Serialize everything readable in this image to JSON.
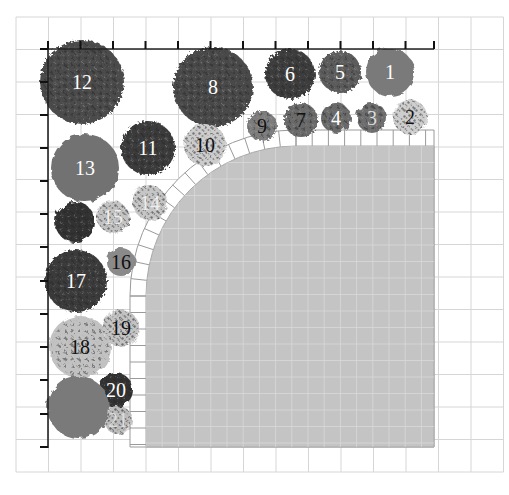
{
  "diagram": {
    "type": "garden-planting-plan",
    "grid": {
      "origin_x": 16,
      "origin_y": 17,
      "cell": 32.5,
      "cols": 15,
      "rows": 14,
      "line_color": "#d6d6d6"
    },
    "rulers": {
      "top": {
        "x1": 42,
        "x2": 434,
        "y": 49,
        "ticks_x": [
          48,
          80.5,
          113,
          145.5,
          178,
          210.5,
          243,
          275.5,
          308,
          340.5,
          373,
          405.5,
          434
        ]
      },
      "left": {
        "x": 48,
        "y1": 49,
        "y2": 448,
        "ticks_y": [
          49,
          82,
          115,
          148,
          181,
          214,
          247,
          281,
          314,
          347,
          380,
          414,
          447
        ]
      }
    },
    "patio": {
      "fill": "#c4c4c4",
      "x": 146,
      "y": 146,
      "width": 288,
      "height": 301,
      "corner_radius": 150,
      "border_band_width": 16
    },
    "plants": [
      {
        "id": "1",
        "label": "1",
        "cx": 390,
        "cy": 72,
        "r": 24,
        "fill": "#7a7a7a",
        "label_color": "#ffffff",
        "style": "solid"
      },
      {
        "id": "2",
        "label": "2",
        "cx": 410,
        "cy": 117,
        "r": 17,
        "fill": "#bdbdbd",
        "label_color": "#111111",
        "style": "speckle"
      },
      {
        "id": "3",
        "label": "3",
        "cx": 372,
        "cy": 118,
        "r": 15,
        "fill": "#6e6e6e",
        "label_color": "#dddddd",
        "style": "blob"
      },
      {
        "id": "4",
        "label": "4",
        "cx": 336,
        "cy": 118,
        "r": 15,
        "fill": "#6a6a6a",
        "label_color": "#ffffff",
        "style": "blob"
      },
      {
        "id": "5",
        "label": "5",
        "cx": 340,
        "cy": 72,
        "r": 21,
        "fill": "#5c5c5c",
        "label_color": "#ffffff",
        "style": "leafy"
      },
      {
        "id": "6",
        "label": "6",
        "cx": 290,
        "cy": 74,
        "r": 25,
        "fill": "#3e3e3e",
        "label_color": "#ffffff",
        "style": "leafy"
      },
      {
        "id": "7",
        "label": "7",
        "cx": 301,
        "cy": 120,
        "r": 17,
        "fill": "#6a6a6a",
        "label_color": "#111111",
        "style": "leafy"
      },
      {
        "id": "8",
        "label": "8",
        "cx": 213,
        "cy": 87,
        "r": 40,
        "fill": "#4a4a4a",
        "label_color": "#ffffff",
        "style": "leafy"
      },
      {
        "id": "9",
        "label": "9",
        "cx": 262,
        "cy": 126,
        "r": 15,
        "fill": "#7d7d7d",
        "label_color": "#111111",
        "style": "leafy"
      },
      {
        "id": "10",
        "label": "10",
        "cx": 205,
        "cy": 145,
        "r": 21,
        "fill": "#b5b5b5",
        "label_color": "#111111",
        "style": "speckle"
      },
      {
        "id": "11",
        "label": "11",
        "cx": 148,
        "cy": 148,
        "r": 27,
        "fill": "#3a3a3a",
        "label_color": "#ffffff",
        "style": "leafy"
      },
      {
        "id": "12",
        "label": "12",
        "cx": 82,
        "cy": 82,
        "r": 42,
        "fill": "#4c4c4c",
        "label_color": "#ffffff",
        "style": "leafy"
      },
      {
        "id": "13",
        "label": "13",
        "cx": 85,
        "cy": 168,
        "r": 34,
        "fill": "#727272",
        "label_color": "#ffffff",
        "style": "solid"
      },
      {
        "id": "14",
        "label": "14",
        "cx": 150,
        "cy": 203,
        "r": 17,
        "fill": "#a3a3a3",
        "label_color": "#eeeeee",
        "style": "speckle"
      },
      {
        "id": "15",
        "label": "15",
        "cx": 113,
        "cy": 217,
        "r": 16,
        "fill": "#9a9a9a",
        "label_color": "#eeeeee",
        "style": "speckle"
      },
      {
        "id": "16",
        "label": "16",
        "cx": 121,
        "cy": 262,
        "r": 14,
        "fill": "#8a8a8a",
        "label_color": "#111111",
        "style": "solid"
      },
      {
        "id": "17",
        "label": "17",
        "cx": 76,
        "cy": 281,
        "r": 31,
        "fill": "#3a3a3a",
        "label_color": "#ffffff",
        "style": "leafy"
      },
      {
        "id": "18",
        "label": "18",
        "cx": 80,
        "cy": 347,
        "r": 31,
        "fill": "#c2c2c2",
        "label_color": "#111111",
        "style": "blob"
      },
      {
        "id": "19",
        "label": "19",
        "cx": 121,
        "cy": 328,
        "r": 18,
        "fill": "#9a9a9a",
        "label_color": "#111111",
        "style": "speckle"
      },
      {
        "id": "20",
        "label": "20",
        "cx": 116,
        "cy": 390,
        "r": 17,
        "fill": "#333333",
        "label_color": "#ffffff",
        "style": "blob"
      },
      {
        "id": "21",
        "label": "21",
        "cx": 118,
        "cy": 420,
        "r": 14,
        "fill": "#8a8a8a",
        "label_color": "#dddddd",
        "style": "speckle"
      },
      {
        "id": "22",
        "label": "",
        "cx": 75,
        "cy": 222,
        "r": 20,
        "fill": "#303030",
        "label_color": "#ffffff",
        "style": "blob"
      },
      {
        "id": "23",
        "label": "",
        "cx": 78,
        "cy": 407,
        "r": 31,
        "fill": "#7a7a7a",
        "label_color": "#ffffff",
        "style": "solid"
      }
    ]
  }
}
